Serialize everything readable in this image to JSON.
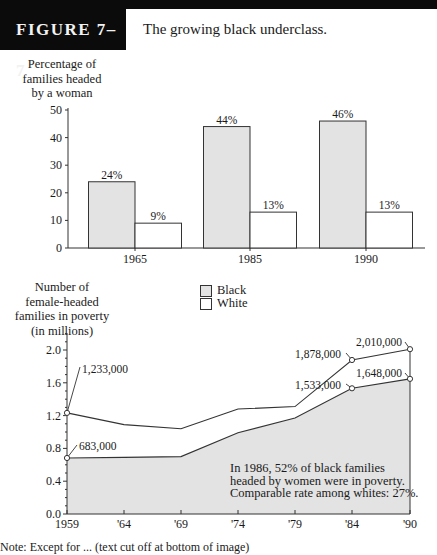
{
  "figure": {
    "label": "FIGURE 7–7",
    "title": "The growing black underclass."
  },
  "colors": {
    "black_series_fill": "#e3e3e3",
    "white_series_fill": "#ffffff",
    "axis": "#333333",
    "header": "#0b0b0b"
  },
  "bar_chart": {
    "ylabel_lines": [
      "Percentage of",
      "families headed",
      "by a woman"
    ]
  },
  "line_chart": {
    "ylabel_lines": [
      "Number of",
      "female-headed",
      "families in poverty",
      "(in millions)"
    ],
    "note_lines": [
      "In 1986, 52% of black families",
      "headed by women were in poverty.",
      "Comparable rate among whites: 27%."
    ]
  },
  "legend": {
    "items": [
      {
        "label": "Black",
        "color": "#e3e3e3"
      },
      {
        "label": "White",
        "color": "#ffffff"
      }
    ]
  },
  "caption": "Note: Except for ... (text cut off at bottom of image)",
  "chart_data": [
    {
      "type": "bar",
      "title": "",
      "ylabel": "Percentage of families headed by a woman",
      "xlabel": "",
      "categories": [
        "1965",
        "1985",
        "1990"
      ],
      "series": [
        {
          "name": "Black",
          "values": [
            24,
            44,
            46
          ],
          "labels": [
            "24%",
            "44%",
            "46%"
          ]
        },
        {
          "name": "White",
          "values": [
            9,
            13,
            13
          ],
          "labels": [
            "9%",
            "13%",
            "13%"
          ]
        }
      ],
      "yticks": [
        0,
        10,
        20,
        30,
        40,
        50
      ],
      "ylim": [
        0,
        50
      ],
      "grid": false
    },
    {
      "type": "line",
      "title": "",
      "ylabel": "Number of female-headed families in poverty (in millions)",
      "xlabel": "",
      "x": [
        "1959",
        "'64",
        "'69",
        "'74",
        "'79",
        "'84",
        "'90"
      ],
      "series": [
        {
          "name": "Total (upper line)",
          "values": [
            1.233,
            1.09,
            1.04,
            1.28,
            1.31,
            1.878,
            2.01
          ],
          "annotations": [
            {
              "x": "1959",
              "label": "1,233,000"
            },
            {
              "x": "'84",
              "label": "1,878,000"
            },
            {
              "x": "'90",
              "label": "2,010,000"
            }
          ]
        },
        {
          "name": "Black (shaded area)",
          "values": [
            0.683,
            0.69,
            0.7,
            0.99,
            1.17,
            1.533,
            1.648
          ],
          "annotations": [
            {
              "x": "1959",
              "label": "683,000"
            },
            {
              "x": "'84",
              "label": "1,533,000"
            },
            {
              "x": "'90",
              "label": "1,648,000"
            }
          ]
        }
      ],
      "yticks": [
        "0.0",
        "0.4",
        "0.8",
        "1.2",
        "1.6",
        "2.0"
      ],
      "ylim": [
        0,
        2.2
      ],
      "legend": {
        "position": "top-center",
        "entries": [
          "Black",
          "White"
        ]
      },
      "grid": false,
      "annotations": [
        "In 1986, 52% of black families headed by women were in poverty. Comparable rate among whites: 27%."
      ]
    }
  ]
}
